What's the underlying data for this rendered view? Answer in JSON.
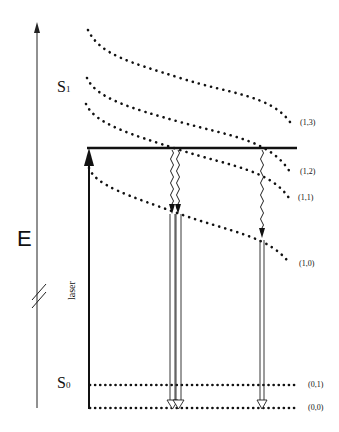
{
  "diagram": {
    "type": "energy-level (Jablonski-style) diagram",
    "axis": {
      "label": "E",
      "break_marker": "//"
    },
    "states": {
      "S1": {
        "label": "S",
        "subscript": "1"
      },
      "S0": {
        "label": "S",
        "subscript": "0"
      }
    },
    "levels": [
      {
        "id": "(1,3)",
        "label": "(1,3)"
      },
      {
        "id": "(1,2)",
        "label": "(1,2)"
      },
      {
        "id": "(1,1)",
        "label": "(1,1)"
      },
      {
        "id": "(1,0)",
        "label": "(1,0)"
      },
      {
        "id": "(0,1)",
        "label": "(0,1)"
      },
      {
        "id": "(0,0)",
        "label": "(0,0)"
      }
    ],
    "arrows": {
      "excitation": {
        "label": "laser"
      },
      "relaxation": "wavy arrows from excitation level to (1,0)",
      "emission": "hollow double-line arrows from (1,0) to (0,0)"
    }
  }
}
